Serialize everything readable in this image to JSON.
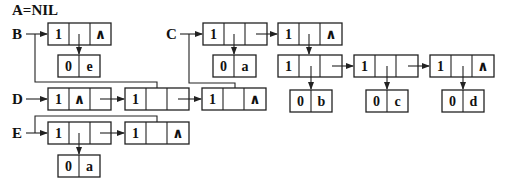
{
  "title": "A=NIL",
  "colors": {
    "stroke": "#222222",
    "text": "#111111",
    "background": "#ffffff"
  },
  "heads": [
    {
      "name": "B"
    },
    {
      "name": "C"
    },
    {
      "name": "D"
    },
    {
      "name": "E"
    }
  ],
  "nodes": {
    "b1": {
      "tag": "1",
      "hp": "",
      "tp": "^"
    },
    "be": {
      "tag": "0",
      "atom": "e"
    },
    "c1": {
      "tag": "1",
      "hp": "",
      "tp": ""
    },
    "ca": {
      "tag": "0",
      "atom": "a"
    },
    "c2": {
      "tag": "1",
      "hp": "",
      "tp": "^"
    },
    "s1": {
      "tag": "1",
      "hp": "",
      "tp": ""
    },
    "sb": {
      "tag": "0",
      "atom": "b"
    },
    "s2": {
      "tag": "1",
      "hp": "",
      "tp": ""
    },
    "sc": {
      "tag": "0",
      "atom": "c"
    },
    "s3": {
      "tag": "1",
      "hp": "",
      "tp": "^"
    },
    "sd": {
      "tag": "0",
      "atom": "d"
    },
    "d1": {
      "tag": "1",
      "hp": "^",
      "tp": ""
    },
    "d2": {
      "tag": "1",
      "hp": "",
      "tp": ""
    },
    "d3": {
      "tag": "1",
      "hp": "",
      "tp": "^"
    },
    "e1": {
      "tag": "1",
      "hp": "",
      "tp": ""
    },
    "ea": {
      "tag": "0",
      "atom": "a"
    },
    "e2": {
      "tag": "1",
      "hp": "",
      "tp": "^"
    }
  }
}
